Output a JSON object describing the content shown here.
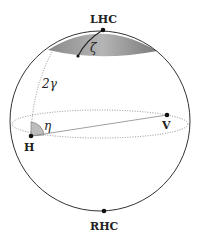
{
  "diagram": {
    "type": "poincare-sphere",
    "labels": {
      "top_pole": "LHC",
      "bottom_pole": "RHC",
      "horizontal": "H",
      "vertical": "V",
      "zeta": "ζ",
      "eta": "η",
      "two_gamma": "2γ"
    },
    "colors": {
      "outline": "#333333",
      "cap_dark": "#7a7a7a",
      "cap_light": "#d0d0d0",
      "angle_fill": "#bdbdbd"
    }
  }
}
